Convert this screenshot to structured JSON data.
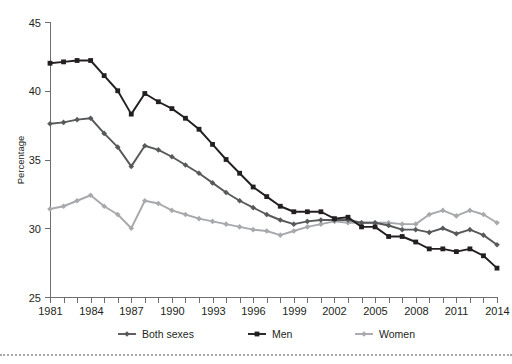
{
  "chart_data": {
    "type": "line",
    "title": "",
    "xlabel": "",
    "ylabel": "Percentage",
    "ylim": [
      25,
      45
    ],
    "xlim": [
      1981,
      2014
    ],
    "yticks": [
      25,
      30,
      35,
      40,
      45
    ],
    "ytick_labels": [
      "25",
      "30",
      "35",
      "40",
      "45"
    ],
    "xticks": [
      1981,
      1982,
      1983,
      1984,
      1985,
      1986,
      1987,
      1988,
      1989,
      1990,
      1991,
      1992,
      1993,
      1994,
      1995,
      1996,
      1997,
      1998,
      1999,
      2000,
      2001,
      2002,
      2003,
      2004,
      2005,
      2006,
      2007,
      2008,
      2009,
      2010,
      2011,
      2012,
      2013,
      2014
    ],
    "xtick_labels_shown": [
      "1981",
      "1984",
      "1987",
      "1990",
      "1993",
      "1996",
      "1999",
      "2002",
      "2005",
      "2008",
      "2011",
      "2014"
    ],
    "grid": false,
    "legend_position": "bottom",
    "x": [
      1981,
      1982,
      1983,
      1984,
      1985,
      1986,
      1987,
      1988,
      1989,
      1990,
      1991,
      1992,
      1993,
      1994,
      1995,
      1996,
      1997,
      1998,
      1999,
      2000,
      2001,
      2002,
      2003,
      2004,
      2005,
      2006,
      2007,
      2008,
      2009,
      2010,
      2011,
      2012,
      2013,
      2014
    ],
    "series": [
      {
        "name": "Both sexes",
        "color": "#58595b",
        "marker": "diamond",
        "values": [
          37.6,
          37.7,
          37.9,
          38.0,
          36.9,
          35.9,
          34.5,
          36.0,
          35.7,
          35.2,
          34.6,
          34.0,
          33.3,
          32.6,
          32.0,
          31.5,
          31.0,
          30.6,
          30.3,
          30.5,
          30.6,
          30.6,
          30.6,
          30.4,
          30.4,
          30.2,
          29.9,
          29.9,
          29.7,
          30.0,
          29.6,
          29.9,
          29.5,
          28.8
        ]
      },
      {
        "name": "Men",
        "color": "#231f20",
        "marker": "square",
        "values": [
          42.0,
          42.1,
          42.2,
          42.2,
          41.1,
          40.0,
          38.3,
          39.8,
          39.2,
          38.7,
          38.0,
          37.2,
          36.1,
          35.0,
          34.0,
          33.0,
          32.3,
          31.6,
          31.2,
          31.2,
          31.2,
          30.7,
          30.8,
          30.1,
          30.1,
          29.4,
          29.4,
          29.0,
          28.5,
          28.5,
          28.3,
          28.5,
          28.0,
          27.1
        ]
      },
      {
        "name": "Women",
        "color": "#a7a9ac",
        "marker": "diamond",
        "values": [
          31.4,
          31.6,
          32.0,
          32.4,
          31.6,
          31.0,
          30.0,
          32.0,
          31.8,
          31.3,
          31.0,
          30.7,
          30.5,
          30.3,
          30.1,
          29.9,
          29.8,
          29.5,
          29.8,
          30.1,
          30.3,
          30.5,
          30.4,
          30.4,
          30.4,
          30.4,
          30.3,
          30.3,
          31.0,
          31.3,
          30.9,
          31.3,
          31.0,
          30.4
        ]
      }
    ],
    "legend": [
      {
        "label": "Both sexes",
        "color": "#58595b",
        "marker": "diamond"
      },
      {
        "label": "Men",
        "color": "#231f20",
        "marker": "square"
      },
      {
        "label": "Women",
        "color": "#a7a9ac",
        "marker": "diamond"
      }
    ]
  }
}
